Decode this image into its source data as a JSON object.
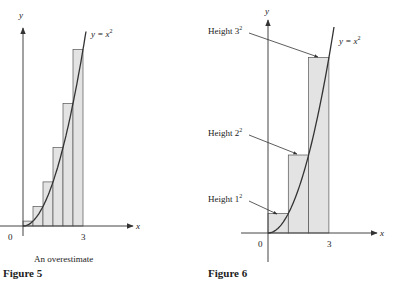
{
  "chart_data": [
    {
      "type": "area",
      "title": "Figure 5",
      "subtitle": "An overestimate",
      "curve_label": "y = x^2",
      "xlabel": "x",
      "ylabel": "y",
      "x_ticks": [
        "0",
        "3"
      ],
      "function": "x^2",
      "rectangles": {
        "count": 6,
        "width": 0.5,
        "endpoint": "right",
        "x_left": [
          0,
          0.5,
          1,
          1.5,
          2,
          2.5
        ],
        "heights": [
          0.25,
          1,
          2.25,
          4,
          6.25,
          9
        ]
      },
      "xlim": [
        0,
        3
      ],
      "ylim": [
        0,
        9
      ]
    },
    {
      "type": "area",
      "title": "Figure 6",
      "curve_label": "y = x^2",
      "xlabel": "x",
      "ylabel": "y",
      "x_ticks": [
        "0",
        "3"
      ],
      "function": "x^2",
      "rectangles": {
        "count": 3,
        "width": 1,
        "endpoint": "right",
        "x_left": [
          0,
          1,
          2
        ],
        "heights": [
          1,
          4,
          9
        ]
      },
      "annotations": [
        "Height 1^2",
        "Height 2^2",
        "Height 3^2"
      ],
      "xlim": [
        0,
        3
      ],
      "ylim": [
        0,
        9
      ]
    }
  ],
  "fig5": {
    "ylabel": "y",
    "xlabel": "x",
    "curve_label_base": "y = x",
    "curve_label_exp": "2",
    "tick_0": "0",
    "tick_3": "3",
    "subtitle": "An overestimate",
    "caption": "Figure 5"
  },
  "fig6": {
    "ylabel": "y",
    "xlabel": "x",
    "curve_label_base": "y = x",
    "curve_label_exp": "2",
    "tick_0": "0",
    "tick_3": "3",
    "height3_base": "Height 3",
    "height2_base": "Height 2",
    "height1_base": "Height 1",
    "exp": "2",
    "caption": "Figure 6"
  },
  "colors": {
    "fill": "#e3e3e3",
    "stroke": "#555555",
    "curve": "#333333",
    "axis": "#444444"
  }
}
